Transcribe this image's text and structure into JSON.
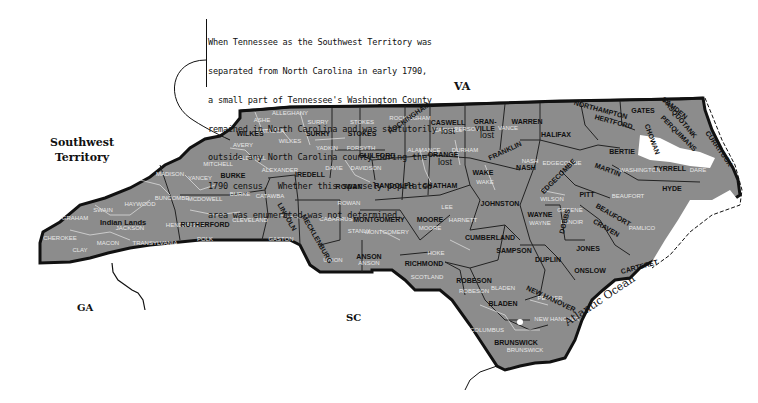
{
  "note": {
    "lines": [
      "When Tennessee as the Southwest Territory was",
      "separated from North Carolina in early 1790,",
      "a small part of Tennessee's Washington County",
      "remained in North Carolina and was statutorily",
      "outside any North Carolina county during the",
      "1790 census.  Whether this sparsely populated",
      "area was enumerated was not determined."
    ]
  },
  "regions": {
    "va": "VA",
    "sw_territory_line1": "Southwest",
    "sw_territory_line2": "Territory",
    "ga": "GA",
    "sc": "SC",
    "ocean": "Atlantic Ocean",
    "indian_lands": "Indian Lands"
  },
  "map": {
    "fill_color": "#8c8c8c",
    "border_color": "#111111",
    "modern_line_color": "#e6e6e6",
    "counties_1790": [
      {
        "name": "WILKES",
        "x": 250,
        "y": 136
      },
      {
        "name": "SURRY",
        "x": 318,
        "y": 136
      },
      {
        "name": "STOKES",
        "x": 362,
        "y": 136
      },
      {
        "name": "ROCKINGHAM",
        "x": 410,
        "y": 120,
        "rotate": -35
      },
      {
        "name": "CASWELL",
        "x": 448,
        "y": 125
      },
      {
        "name": "GRAN-",
        "x": 485,
        "y": 124
      },
      {
        "name": "VILLE",
        "x": 485,
        "y": 131
      },
      {
        "name": "WARREN",
        "x": 527,
        "y": 124
      },
      {
        "name": "NORTHAMPTON",
        "x": 600,
        "y": 112,
        "rotate": 15
      },
      {
        "name": "HERTFORD",
        "x": 613,
        "y": 124,
        "rotate": 15
      },
      {
        "name": "GATES",
        "x": 643,
        "y": 113
      },
      {
        "name": "CAMDEN",
        "x": 673,
        "y": 110,
        "rotate": 40
      },
      {
        "name": "PASQUOTANK",
        "x": 678,
        "y": 120,
        "rotate": 50
      },
      {
        "name": "PERQUIMANS",
        "x": 677,
        "y": 135,
        "rotate": 45
      },
      {
        "name": "CHOWAN",
        "x": 650,
        "y": 140,
        "rotate": 70
      },
      {
        "name": "CURRITUCK",
        "x": 717,
        "y": 150,
        "rotate": 55
      },
      {
        "name": "HALIFAX",
        "x": 556,
        "y": 137
      },
      {
        "name": "BERTIE",
        "x": 622,
        "y": 154
      },
      {
        "name": "TYRRELL",
        "x": 670,
        "y": 171
      },
      {
        "name": "HYDE",
        "x": 672,
        "y": 191
      },
      {
        "name": "MARTIN",
        "x": 607,
        "y": 172,
        "rotate": 20
      },
      {
        "name": "GUILFORD",
        "x": 377,
        "y": 158
      },
      {
        "name": "ORANGE",
        "x": 443,
        "y": 157
      },
      {
        "name": "FRANKLIN",
        "x": 506,
        "y": 153,
        "rotate": -25
      },
      {
        "name": "NASH",
        "x": 526,
        "y": 170
      },
      {
        "name": "EDGECOMBE",
        "x": 560,
        "y": 178,
        "rotate": -45
      },
      {
        "name": "PITT",
        "x": 587,
        "y": 197
      },
      {
        "name": "BEAUFORT",
        "x": 612,
        "y": 217,
        "rotate": 30
      },
      {
        "name": "CRAVEN",
        "x": 605,
        "y": 230,
        "rotate": 30
      },
      {
        "name": "CARTERET",
        "x": 640,
        "y": 269,
        "rotate": -15
      },
      {
        "name": "WAKE",
        "x": 483,
        "y": 175
      },
      {
        "name": "BURKE",
        "x": 233,
        "y": 178
      },
      {
        "name": "IREDELL",
        "x": 310,
        "y": 177
      },
      {
        "name": "ROWAN",
        "x": 349,
        "y": 189
      },
      {
        "name": "RANDOLPH",
        "x": 394,
        "y": 188
      },
      {
        "name": "CHATHAM",
        "x": 440,
        "y": 188
      },
      {
        "name": "JOHNSTON",
        "x": 500,
        "y": 206
      },
      {
        "name": "WAYNE",
        "x": 540,
        "y": 217
      },
      {
        "name": "DOBBS",
        "x": 567,
        "y": 222,
        "rotate": -75
      },
      {
        "name": "JONES",
        "x": 588,
        "y": 251
      },
      {
        "name": "RUTHERFORD",
        "x": 205,
        "y": 227
      },
      {
        "name": "LINCOLN",
        "x": 285,
        "y": 218,
        "rotate": 60
      },
      {
        "name": "MECKLENBURG",
        "x": 315,
        "y": 240,
        "rotate": 60
      },
      {
        "name": "MONTGOMERY",
        "x": 379,
        "y": 222
      },
      {
        "name": "MOORE",
        "x": 430,
        "y": 222
      },
      {
        "name": "CUMBERLAND",
        "x": 490,
        "y": 240
      },
      {
        "name": "SAMPSON",
        "x": 514,
        "y": 253
      },
      {
        "name": "DUPLIN",
        "x": 548,
        "y": 262
      },
      {
        "name": "ONSLOW",
        "x": 590,
        "y": 273
      },
      {
        "name": "ANSON",
        "x": 369,
        "y": 259
      },
      {
        "name": "RICHMOND",
        "x": 424,
        "y": 266
      },
      {
        "name": "ROBESON",
        "x": 474,
        "y": 283
      },
      {
        "name": "BLADEN",
        "x": 503,
        "y": 306
      },
      {
        "name": "NEW HANOVER",
        "x": 550,
        "y": 301,
        "rotate": 25
      },
      {
        "name": "BRUNSWICK",
        "x": 516,
        "y": 345
      }
    ],
    "counties_modern": [
      {
        "name": "ASHE",
        "x": 262,
        "y": 122
      },
      {
        "name": "ALLEGHANY",
        "x": 290,
        "y": 115
      },
      {
        "name": "SURRY",
        "x": 318,
        "y": 124
      },
      {
        "name": "STOKES",
        "x": 362,
        "y": 124
      },
      {
        "name": "YADKIN",
        "x": 327,
        "y": 150
      },
      {
        "name": "FORSYTH",
        "x": 361,
        "y": 150
      },
      {
        "name": "WILKES",
        "x": 290,
        "y": 143
      },
      {
        "name": "AVERY",
        "x": 243,
        "y": 147
      },
      {
        "name": "WATAUGA",
        "x": 270,
        "y": 133
      },
      {
        "name": "CALDWELL",
        "x": 250,
        "y": 160
      },
      {
        "name": "ALEXANDER",
        "x": 280,
        "y": 172
      },
      {
        "name": "DAVIE",
        "x": 334,
        "y": 170
      },
      {
        "name": "DAVIDSON",
        "x": 366,
        "y": 170
      },
      {
        "name": "BURKE",
        "x": 240,
        "y": 196
      },
      {
        "name": "CATAWBA",
        "x": 270,
        "y": 198
      },
      {
        "name": "ROWAN",
        "x": 349,
        "y": 205
      },
      {
        "name": "CABARRUS",
        "x": 336,
        "y": 221
      },
      {
        "name": "STANLY",
        "x": 359,
        "y": 233
      },
      {
        "name": "MONTGOMERY",
        "x": 387,
        "y": 234
      },
      {
        "name": "MOORE",
        "x": 430,
        "y": 230
      },
      {
        "name": "LEE",
        "x": 447,
        "y": 209
      },
      {
        "name": "HARNETT",
        "x": 463,
        "y": 222
      },
      {
        "name": "HOKE",
        "x": 436,
        "y": 255
      },
      {
        "name": "SCOTLAND",
        "x": 427,
        "y": 279
      },
      {
        "name": "UNION",
        "x": 333,
        "y": 262
      },
      {
        "name": "ANSON",
        "x": 369,
        "y": 265
      },
      {
        "name": "GASTON",
        "x": 281,
        "y": 241
      },
      {
        "name": "CLEVELAND",
        "x": 250,
        "y": 222
      },
      {
        "name": "POLK",
        "x": 205,
        "y": 241
      },
      {
        "name": "HENDERSON",
        "x": 185,
        "y": 227
      },
      {
        "name": "BUNCOMBE",
        "x": 172,
        "y": 200
      },
      {
        "name": "MCDOWELL",
        "x": 205,
        "y": 201
      },
      {
        "name": "YANCEY",
        "x": 200,
        "y": 180
      },
      {
        "name": "MITCHELL",
        "x": 218,
        "y": 166
      },
      {
        "name": "MADISON",
        "x": 170,
        "y": 176
      },
      {
        "name": "HAYWOOD",
        "x": 140,
        "y": 206
      },
      {
        "name": "SWAIN",
        "x": 103,
        "y": 212
      },
      {
        "name": "GRAHAM",
        "x": 75,
        "y": 220
      },
      {
        "name": "JACKSON",
        "x": 130,
        "y": 230
      },
      {
        "name": "TRANSYLVANIA",
        "x": 155,
        "y": 245
      },
      {
        "name": "CHEROKEE",
        "x": 60,
        "y": 240
      },
      {
        "name": "MACON",
        "x": 108,
        "y": 245
      },
      {
        "name": "CLAY",
        "x": 80,
        "y": 252
      },
      {
        "name": "ROCKINGHAM",
        "x": 410,
        "y": 120
      },
      {
        "name": "CASWELL",
        "x": 448,
        "y": 132
      },
      {
        "name": "PERSON",
        "x": 467,
        "y": 131
      },
      {
        "name": "ALAMANCE",
        "x": 424,
        "y": 152
      },
      {
        "name": "DURHAM",
        "x": 465,
        "y": 152
      },
      {
        "name": "WAKE",
        "x": 485,
        "y": 184
      },
      {
        "name": "VANCE",
        "x": 508,
        "y": 130
      },
      {
        "name": "NASH",
        "x": 530,
        "y": 163
      },
      {
        "name": "EDGECOMBE",
        "x": 562,
        "y": 165
      },
      {
        "name": "WILSON",
        "x": 552,
        "y": 201
      },
      {
        "name": "GREENE",
        "x": 570,
        "y": 212
      },
      {
        "name": "LENOIR",
        "x": 572,
        "y": 224
      },
      {
        "name": "WAYNE",
        "x": 540,
        "y": 225
      },
      {
        "name": "BEAUFORT",
        "x": 628,
        "y": 198
      },
      {
        "name": "PAMLICO",
        "x": 642,
        "y": 230
      },
      {
        "name": "WASHINGTON",
        "x": 640,
        "y": 172
      },
      {
        "name": "DARE",
        "x": 698,
        "y": 172
      },
      {
        "name": "ROBESON",
        "x": 474,
        "y": 293
      },
      {
        "name": "BLADEN",
        "x": 503,
        "y": 290
      },
      {
        "name": "COLUMBUS",
        "x": 487,
        "y": 332
      },
      {
        "name": "BRUNSWICK",
        "x": 525,
        "y": 352
      },
      {
        "name": "PENDER",
        "x": 550,
        "y": 300
      },
      {
        "name": "NEW HANOVER",
        "x": 557,
        "y": 321
      }
    ],
    "lost_labels": [
      {
        "text": "lost",
        "x": 448,
        "y": 134
      },
      {
        "text": "lost",
        "x": 487,
        "y": 138
      },
      {
        "text": "lost",
        "x": 445,
        "y": 165
      }
    ]
  }
}
